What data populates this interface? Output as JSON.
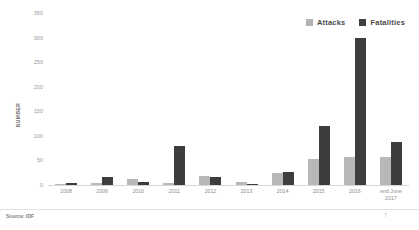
{
  "chart_data": {
    "type": "bar",
    "title": "",
    "subtitle": "",
    "xlabel": "",
    "ylabel": "NUMBER",
    "ylim": [
      0,
      350
    ],
    "yticks": [
      0,
      50,
      100,
      150,
      200,
      250,
      300,
      350
    ],
    "ytick_labels": [
      "0",
      "50",
      "100",
      "150",
      "200",
      "250",
      "300",
      "350"
    ],
    "grid": false,
    "legend_position": "top-right",
    "categories": [
      "2008",
      "2009",
      "2010",
      "2011",
      "2012",
      "2013",
      "2014",
      "2015",
      "2016",
      "end June\n2017"
    ],
    "series": [
      {
        "name": "Attacks",
        "color": "#b8b8b8",
        "values": [
          3,
          4,
          13,
          4,
          18,
          6,
          25,
          53,
          57,
          58
        ]
      },
      {
        "name": "Fatalities",
        "color": "#3d3d3d",
        "values": [
          4,
          17,
          6,
          80,
          16,
          3,
          26,
          120,
          300,
          88
        ]
      }
    ],
    "annotations": {
      "source": "Source: IDF",
      "page_mark": "7"
    }
  },
  "legend": {
    "items": [
      {
        "label": "Attacks",
        "swatch": "legend-swatch-attacks"
      },
      {
        "label": "Fatalities",
        "swatch": "legend-swatch-fatalities"
      }
    ]
  },
  "footer": {
    "source": "Source: IDF",
    "page_mark": "7"
  },
  "colors": {
    "attacks": "#b8b8b8",
    "fatalities": "#3d3d3d",
    "axis": "#d8d8d8",
    "tick_text": "#9a9a9a",
    "label_text": "#8e8e8e"
  }
}
